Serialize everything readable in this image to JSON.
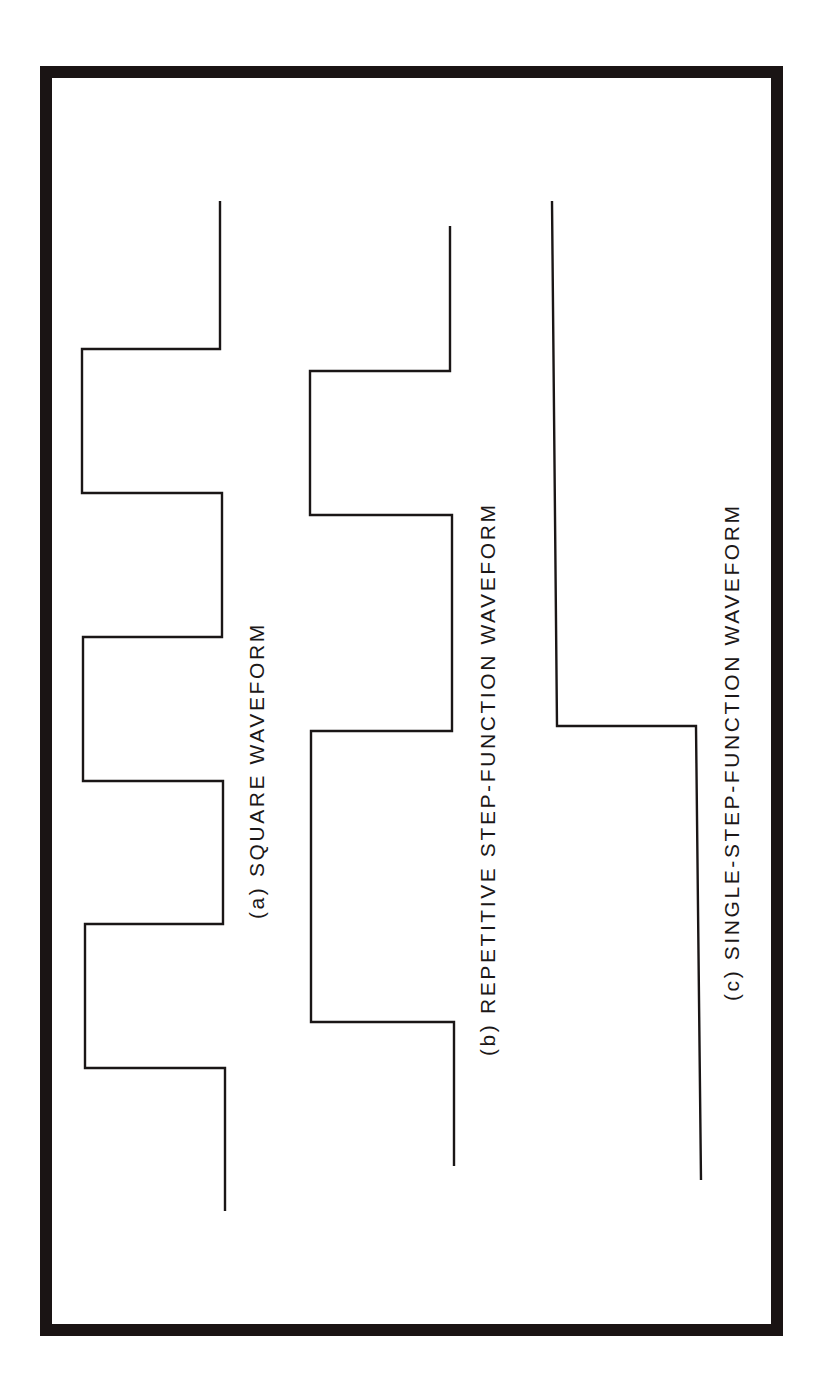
{
  "figure": {
    "frame": {
      "border_color": "#1a1414",
      "background": "#ffffff"
    },
    "waveforms": [
      {
        "id": "a",
        "label": "(a) SQUARE WAVEFORM",
        "type": "square",
        "stroke": "#1a1616"
      },
      {
        "id": "b",
        "label": "(b) REPETITIVE STEP-FUNCTION WAVEFORM",
        "type": "repetitive-step",
        "stroke": "#1a1616"
      },
      {
        "id": "c",
        "label": "(c) SINGLE-STEP-FUNCTION WAVEFORM",
        "type": "single-step",
        "stroke": "#1a1616"
      }
    ]
  }
}
